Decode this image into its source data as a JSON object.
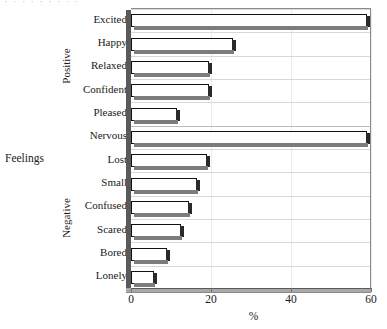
{
  "chart_data": {
    "type": "bar",
    "orientation": "horizontal",
    "title": "",
    "xlabel": "%",
    "ylabel": "Feelings",
    "xlim": [
      0,
      60
    ],
    "xticks": [
      0,
      20,
      40,
      60
    ],
    "xtick_labels": [
      "0",
      "20",
      "40",
      "60"
    ],
    "grid": true,
    "grid_orientation": "horizontal",
    "legend": "none",
    "groups": [
      {
        "name": "Positive",
        "categories": [
          "Excited",
          "Happy",
          "Relaxed",
          "Confident",
          "Pleased"
        ],
        "values": [
          59,
          25.6,
          19.6,
          19.6,
          11.4
        ]
      },
      {
        "name": "Negative",
        "categories": [
          "Nervous",
          "Lost",
          "Small",
          "Confused",
          "Scared",
          "Bored",
          "Lonely"
        ],
        "values": [
          59,
          19,
          16.5,
          14.4,
          12.4,
          8.9,
          5.8
        ]
      }
    ],
    "categories": [
      "Excited",
      "Happy",
      "Relaxed",
      "Confident",
      "Pleased",
      "Nervous",
      "Lost",
      "Small",
      "Confused",
      "Scared",
      "Bored",
      "Lonely"
    ],
    "values": [
      59,
      25.6,
      19.6,
      19.6,
      11.4,
      59,
      19,
      16.5,
      14.4,
      12.4,
      8.9,
      5.8
    ],
    "bar_style": {
      "fill": "#ffffff",
      "edge": "#111111",
      "shadow": "#2a2a2a",
      "base_shadow": "#7c7c7c"
    }
  },
  "axes": {
    "y_axis_title": "Feelings",
    "x_axis_title": "%",
    "group_labels": [
      "Positive",
      "Negative"
    ]
  },
  "top_remnant": "·  ·    ·   ·    ·   ·  ·  ·   ·"
}
